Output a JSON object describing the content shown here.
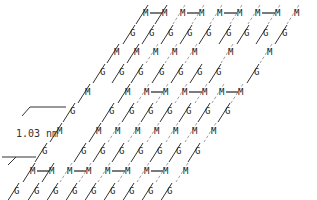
{
  "diagram": {
    "type": "molecular-lattice",
    "atom_labels": {
      "metal": "M",
      "guanine": "G"
    },
    "scale_bar": {
      "label": "1.03 nm",
      "value": 1.03,
      "unit": "nm"
    },
    "colors": {
      "ink": "#222222",
      "faint": "#888888",
      "background": "#ffffff"
    },
    "rows": [
      {
        "y": 13,
        "kind": "M",
        "x": [
          146,
          165,
          183,
          202,
          220,
          240,
          258,
          278,
          297
        ],
        "pairs": [
          [
            146,
            165
          ],
          [
            183,
            202
          ],
          [
            220,
            240
          ],
          [
            258,
            278
          ]
        ]
      },
      {
        "y": 33,
        "kind": "G",
        "x": [
          133,
          152,
          171,
          190,
          209,
          229,
          247,
          266,
          285
        ]
      },
      {
        "y": 52,
        "kind": "M",
        "x": [
          117,
          137,
          156,
          175,
          195,
          231,
          270
        ]
      },
      {
        "y": 72,
        "kind": "G",
        "x": [
          103,
          122,
          141,
          162,
          181,
          200,
          219,
          257
        ]
      },
      {
        "y": 92,
        "kind": "M",
        "x": [
          88,
          128,
          147,
          166,
          185,
          205,
          222,
          241
        ],
        "pairs": [
          [
            147,
            166
          ],
          [
            185,
            205
          ],
          [
            222,
            241
          ]
        ]
      },
      {
        "y": 111,
        "kind": "G",
        "x": [
          73,
          112,
          132,
          151,
          170,
          189,
          208,
          228
        ]
      },
      {
        "y": 131,
        "kind": "M",
        "x": [
          60,
          99,
          118,
          138,
          157,
          176,
          195,
          214
        ]
      },
      {
        "y": 151,
        "kind": "G",
        "x": [
          45,
          84,
          103,
          122,
          141,
          160,
          179,
          198
        ]
      },
      {
        "y": 171,
        "kind": "M",
        "x": [
          33,
          52,
          70,
          89,
          108,
          128,
          147,
          166,
          186
        ],
        "pairs": [
          [
            33,
            52
          ],
          [
            70,
            89
          ],
          [
            108,
            128
          ],
          [
            147,
            166
          ]
        ]
      },
      {
        "y": 191,
        "kind": "G",
        "x": [
          17,
          37,
          56,
          75,
          94,
          113,
          132,
          151,
          170
        ]
      }
    ]
  }
}
